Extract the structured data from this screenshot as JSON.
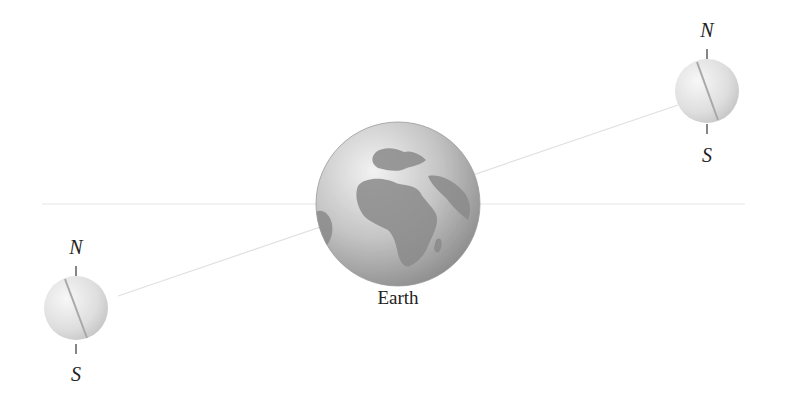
{
  "diagram": {
    "earth": {
      "label": "Earth",
      "icon": "globe-africa-europe"
    },
    "moons": [
      {
        "id": "moon-right",
        "north_label": "N",
        "south_label": "S"
      },
      {
        "id": "moon-left",
        "north_label": "N",
        "south_label": "S"
      }
    ],
    "colors": {
      "horizontal_line": "#e6e6e6",
      "orbit_line": "#e0e0e0",
      "ocean": "#c9c9c9",
      "land": "#8f8f8f",
      "moon": "#e2e2e2",
      "text": "#222222"
    }
  }
}
